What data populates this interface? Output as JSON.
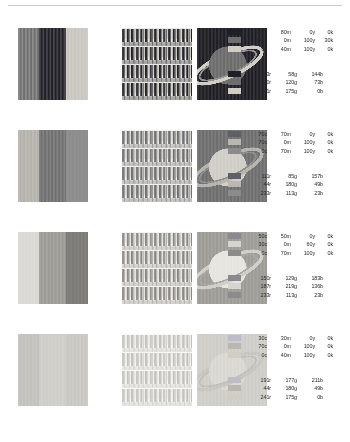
{
  "page": {
    "background": "#ffffff",
    "rule_color": "#c9c9c9",
    "width": 350,
    "height": 442
  },
  "chart_data": {
    "type": "table",
    "xlabel": "",
    "ylabel": "",
    "legend_position": "right",
    "grid": false,
    "columns": [
      "bands-panel",
      "stripes-panel",
      "saturn-panel",
      "cmyk-legend",
      "rgb-legend"
    ],
    "categories": [
      "row-1",
      "row-2",
      "row-3",
      "row-4"
    ],
    "series": [
      {
        "name": "row-1",
        "cmyk_values": [
          [
            100,
            80,
            0,
            0
          ],
          [
            100,
            0,
            100,
            30
          ],
          [
            0,
            40,
            100,
            0
          ]
        ],
        "rgb_values": [
          [
            53,
            58,
            144
          ],
          [
            0,
            120,
            73
          ],
          [
            241,
            175,
            0
          ]
        ]
      },
      {
        "name": "row-2",
        "cmyk_values": [
          [
            70,
            70,
            0,
            0
          ],
          [
            70,
            0,
            100,
            0
          ],
          [
            0,
            70,
            100,
            0
          ]
        ],
        "rgb_values": [
          [
            111,
            85,
            157
          ],
          [
            44,
            180,
            49
          ],
          [
            233,
            113,
            23
          ]
        ]
      },
      {
        "name": "row-3",
        "cmyk_values": [
          [
            50,
            50,
            0,
            0
          ],
          [
            30,
            0,
            60,
            0
          ],
          [
            0,
            70,
            100,
            0
          ]
        ],
        "rgb_values": [
          [
            150,
            129,
            183
          ],
          [
            187,
            219,
            136
          ],
          [
            233,
            113,
            23
          ]
        ]
      },
      {
        "name": "row-4",
        "cmyk_values": [
          [
            30,
            30,
            0,
            0
          ],
          [
            70,
            0,
            100,
            0
          ],
          [
            0,
            40,
            100,
            0
          ]
        ],
        "rgb_values": [
          [
            191,
            177,
            211
          ],
          [
            44,
            180,
            49
          ],
          [
            241,
            175,
            0
          ]
        ]
      }
    ]
  },
  "rows": [
    {
      "id": "row-1",
      "bands": [
        "#6e6e6e",
        "#201f26",
        "#cfcdc4"
      ],
      "stripes": {
        "dark": "#232227",
        "mid": "#6a6a6a",
        "light": "#c9c7bf",
        "bg": "#e9e8e4"
      },
      "planet": {
        "space": "#1e1d23",
        "globe": "#6b6b6b",
        "ring_outer": "#cfcdc4",
        "ring_inner": "#8e8e8e"
      },
      "cmyk": [
        {
          "swatch": "#201f26",
          "c": "100c",
          "m": "80m",
          "y": "0y",
          "k": "0k"
        },
        {
          "swatch": "#6e6e6e",
          "c": "100c",
          "m": "0m",
          "y": "100y",
          "k": "30k"
        },
        {
          "swatch": "#cfcdc4",
          "c": "0c",
          "m": "40m",
          "y": "100y",
          "k": "0k"
        }
      ],
      "rgb": [
        {
          "swatch": "#201f26",
          "r": "53r",
          "g": "58g",
          "b": "144b"
        },
        {
          "swatch": "#6e6e6e",
          "r": "0r",
          "g": "120g",
          "b": "73b"
        },
        {
          "swatch": "#cfcdc4",
          "r": "241r",
          "g": "175g",
          "b": "0b"
        }
      ]
    },
    {
      "id": "row-2",
      "bands": [
        "#b4b2ab",
        "#6f6f6f",
        "#8d8d8d"
      ],
      "stripes": {
        "dark": "#6f6f6f",
        "mid": "#9a9a9a",
        "light": "#d7d5cf",
        "bg": "#efeeea"
      },
      "planet": {
        "space": "#6e6e6e",
        "globe": "#cfcdc6",
        "ring_outer": "#b3b1aa",
        "ring_inner": "#8a8a8a"
      },
      "cmyk": [
        {
          "swatch": "#5f5f66",
          "c": "70c",
          "m": "70m",
          "y": "0y",
          "k": "0k"
        },
        {
          "swatch": "#b9b7b0",
          "c": "70c",
          "m": "0m",
          "y": "100y",
          "k": "0k"
        },
        {
          "swatch": "#8b8b8b",
          "c": "0c",
          "m": "70m",
          "y": "100y",
          "k": "0k"
        }
      ],
      "rgb": [
        {
          "swatch": "#5f5f66",
          "r": "111r",
          "g": "85g",
          "b": "157b"
        },
        {
          "swatch": "#b9b7b0",
          "r": "44r",
          "g": "180g",
          "b": "49b"
        },
        {
          "swatch": "#8b8b8b",
          "r": "233r",
          "g": "113g",
          "b": "23b"
        }
      ]
    },
    {
      "id": "row-3",
      "bands": [
        "#dedcd6",
        "#9d9b95",
        "#7d7b76"
      ],
      "stripes": {
        "dark": "#8a8884",
        "mid": "#b6b4ae",
        "light": "#e3e1db",
        "bg": "#f3f2ef"
      },
      "planet": {
        "space": "#9d9b95",
        "globe": "#e6e4de",
        "ring_outer": "#cfcdc7",
        "ring_inner": "#a6a49e"
      },
      "cmyk": [
        {
          "swatch": "#8a8890",
          "c": "50c",
          "m": "50m",
          "y": "0y",
          "k": "0k"
        },
        {
          "swatch": "#d6d4ce",
          "c": "30c",
          "m": "0m",
          "y": "60y",
          "k": "0k"
        },
        {
          "swatch": "#8b8b8b",
          "c": "0c",
          "m": "70m",
          "y": "100y",
          "k": "0k"
        }
      ],
      "rgb": [
        {
          "swatch": "#8a8890",
          "r": "150r",
          "g": "129g",
          "b": "183b"
        },
        {
          "swatch": "#d6d4ce",
          "r": "187r",
          "g": "219g",
          "b": "136b"
        },
        {
          "swatch": "#8b8b8b",
          "r": "233r",
          "g": "113g",
          "b": "23b"
        }
      ]
    },
    {
      "id": "row-4",
      "bands": [
        "#c3c1bb",
        "#d3d1cb",
        "#ceccc6"
      ],
      "stripes": {
        "dark": "#c4c2bc",
        "mid": "#d5d3cd",
        "light": "#ececea",
        "bg": "#f7f7f5"
      },
      "planet": {
        "space": "#cfcdc7",
        "globe": "#d9d7d1",
        "ring_outer": "#c6c4be",
        "ring_inner": "#bfbdb7"
      },
      "cmyk": [
        {
          "swatch": "#bebcc6",
          "c": "30c",
          "m": "30m",
          "y": "0y",
          "k": "0k"
        },
        {
          "swatch": "#b9b7b0",
          "c": "70c",
          "m": "0m",
          "y": "100y",
          "k": "0k"
        },
        {
          "swatch": "#cfcdc4",
          "c": "0c",
          "m": "40m",
          "y": "100y",
          "k": "0k"
        }
      ],
      "rgb": [
        {
          "swatch": "#bebcc6",
          "r": "191r",
          "g": "177g",
          "b": "211b"
        },
        {
          "swatch": "#b9b7b0",
          "r": "44r",
          "g": "180g",
          "b": "49b"
        },
        {
          "swatch": "#cfcdc4",
          "r": "241r",
          "g": "175g",
          "b": "0b"
        }
      ]
    }
  ]
}
